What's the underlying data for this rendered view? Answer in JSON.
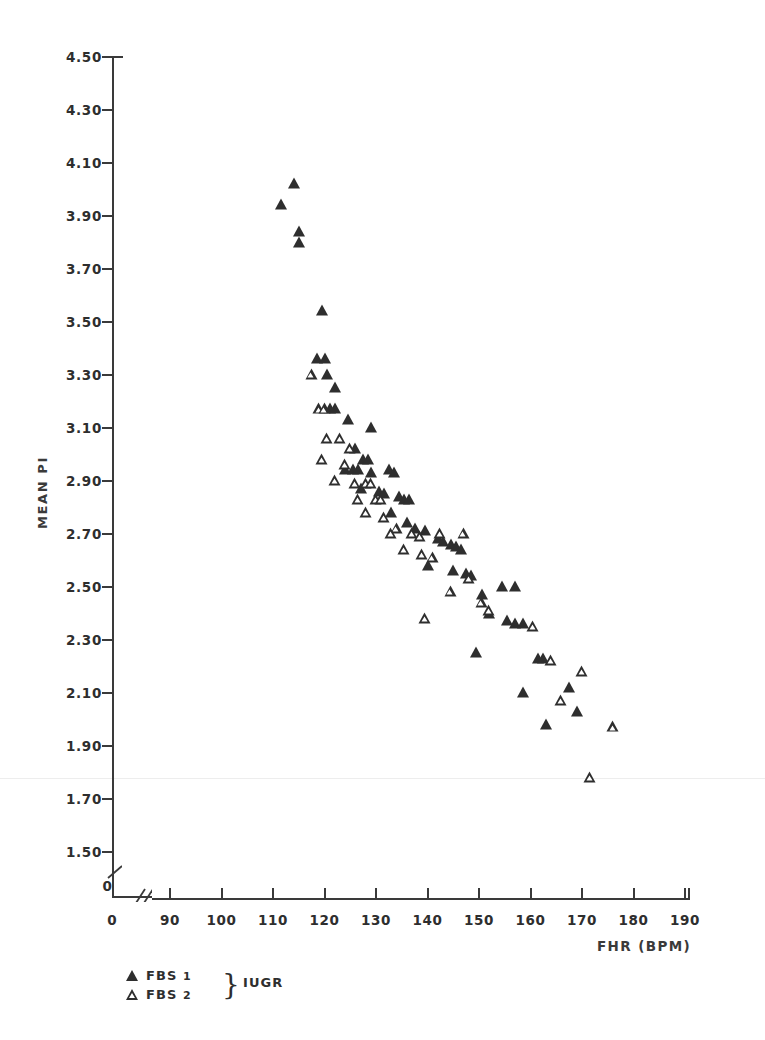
{
  "chart_data": {
    "type": "scatter",
    "title": "",
    "xlabel": "FHR (BPM)",
    "ylabel": "MEAN PI",
    "xlim": [
      85,
      192
    ],
    "ylim": [
      1.42,
      4.56
    ],
    "grid": false,
    "axis_break": {
      "x": true,
      "y": true,
      "zero_label": "0"
    },
    "xticks": [
      90,
      100,
      110,
      120,
      130,
      140,
      150,
      160,
      170,
      180,
      190
    ],
    "xtick_labels": [
      "90",
      "100",
      "110",
      "120",
      "130",
      "140",
      "150",
      "160",
      "170",
      "180",
      "190"
    ],
    "yticks": [
      1.5,
      1.7,
      1.9,
      2.1,
      2.3,
      2.5,
      2.7,
      2.9,
      3.1,
      3.3,
      3.5,
      3.7,
      3.9,
      4.1,
      4.3,
      4.5
    ],
    "ytick_labels": [
      "1.50",
      "1.70",
      "1.90",
      "2.10",
      "2.30",
      "2.50",
      "2.70",
      "2.90",
      "3.10",
      "3.30",
      "3.50",
      "3.70",
      "3.90",
      "4.10",
      "4.30",
      "4.50"
    ],
    "legend_position": "below-left",
    "series": [
      {
        "name": "FBS 1",
        "marker": "filled-triangle",
        "color": "#2e2e2e",
        "points": [
          [
            111.5,
            3.94
          ],
          [
            114.0,
            4.02
          ],
          [
            115.0,
            3.84
          ],
          [
            115.0,
            3.8
          ],
          [
            119.5,
            3.54
          ],
          [
            118.5,
            3.36
          ],
          [
            120.0,
            3.36
          ],
          [
            120.5,
            3.3
          ],
          [
            122.0,
            3.25
          ],
          [
            121.0,
            3.17
          ],
          [
            122.0,
            3.17
          ],
          [
            124.5,
            3.13
          ],
          [
            129.0,
            3.1
          ],
          [
            126.0,
            3.02
          ],
          [
            127.5,
            2.98
          ],
          [
            128.5,
            2.98
          ],
          [
            124.0,
            2.94
          ],
          [
            125.5,
            2.94
          ],
          [
            126.5,
            2.94
          ],
          [
            129.0,
            2.93
          ],
          [
            132.5,
            2.94
          ],
          [
            133.5,
            2.93
          ],
          [
            127.0,
            2.87
          ],
          [
            130.5,
            2.86
          ],
          [
            131.5,
            2.85
          ],
          [
            134.5,
            2.84
          ],
          [
            135.5,
            2.83
          ],
          [
            136.5,
            2.83
          ],
          [
            133.0,
            2.78
          ],
          [
            136.0,
            2.74
          ],
          [
            137.5,
            2.72
          ],
          [
            139.5,
            2.71
          ],
          [
            142.0,
            2.68
          ],
          [
            143.0,
            2.67
          ],
          [
            144.5,
            2.66
          ],
          [
            145.5,
            2.65
          ],
          [
            146.5,
            2.64
          ],
          [
            140.0,
            2.58
          ],
          [
            145.0,
            2.56
          ],
          [
            147.5,
            2.55
          ],
          [
            148.5,
            2.54
          ],
          [
            150.5,
            2.47
          ],
          [
            154.5,
            2.5
          ],
          [
            157.0,
            2.5
          ],
          [
            152.0,
            2.4
          ],
          [
            155.5,
            2.37
          ],
          [
            157.0,
            2.36
          ],
          [
            158.5,
            2.36
          ],
          [
            149.5,
            2.25
          ],
          [
            161.5,
            2.23
          ],
          [
            162.5,
            2.23
          ],
          [
            158.5,
            2.1
          ],
          [
            167.5,
            2.12
          ],
          [
            163.0,
            1.98
          ],
          [
            169.0,
            2.03
          ]
        ]
      },
      {
        "name": "FBS 2",
        "marker": "open-triangle",
        "color": "#2e2e2e",
        "points": [
          [
            117.5,
            3.3
          ],
          [
            119.0,
            3.17
          ],
          [
            120.0,
            3.17
          ],
          [
            120.5,
            3.06
          ],
          [
            119.5,
            2.98
          ],
          [
            123.0,
            3.06
          ],
          [
            125.0,
            3.02
          ],
          [
            124.0,
            2.96
          ],
          [
            122.0,
            2.9
          ],
          [
            126.0,
            2.89
          ],
          [
            128.0,
            2.89
          ],
          [
            129.0,
            2.89
          ],
          [
            126.5,
            2.83
          ],
          [
            130.0,
            2.83
          ],
          [
            131.0,
            2.83
          ],
          [
            128.0,
            2.78
          ],
          [
            131.5,
            2.76
          ],
          [
            134.0,
            2.72
          ],
          [
            133.0,
            2.7
          ],
          [
            137.0,
            2.7
          ],
          [
            138.5,
            2.69
          ],
          [
            135.5,
            2.64
          ],
          [
            139.0,
            2.62
          ],
          [
            142.5,
            2.7
          ],
          [
            141.0,
            2.61
          ],
          [
            139.5,
            2.38
          ],
          [
            147.0,
            2.7
          ],
          [
            148.0,
            2.53
          ],
          [
            144.5,
            2.48
          ],
          [
            150.5,
            2.44
          ],
          [
            152.0,
            2.41
          ],
          [
            160.5,
            2.35
          ],
          [
            164.0,
            2.22
          ],
          [
            170.0,
            2.18
          ],
          [
            166.0,
            2.07
          ],
          [
            171.5,
            1.78
          ],
          [
            176.0,
            1.97
          ]
        ]
      }
    ],
    "legend_brace_label": "IUGR"
  },
  "axis": {
    "y_title": "MEAN PI",
    "x_title": "FHR (BPM)",
    "zero_y_label": "0",
    "zero_x_label": "0"
  },
  "legend": {
    "items": [
      {
        "label_main": "FBS",
        "label_num": "1",
        "marker": "filled-triangle"
      },
      {
        "label_main": "FBS",
        "label_num": "2",
        "marker": "open-triangle"
      }
    ],
    "brace": "}",
    "group_label": "IUGR"
  }
}
